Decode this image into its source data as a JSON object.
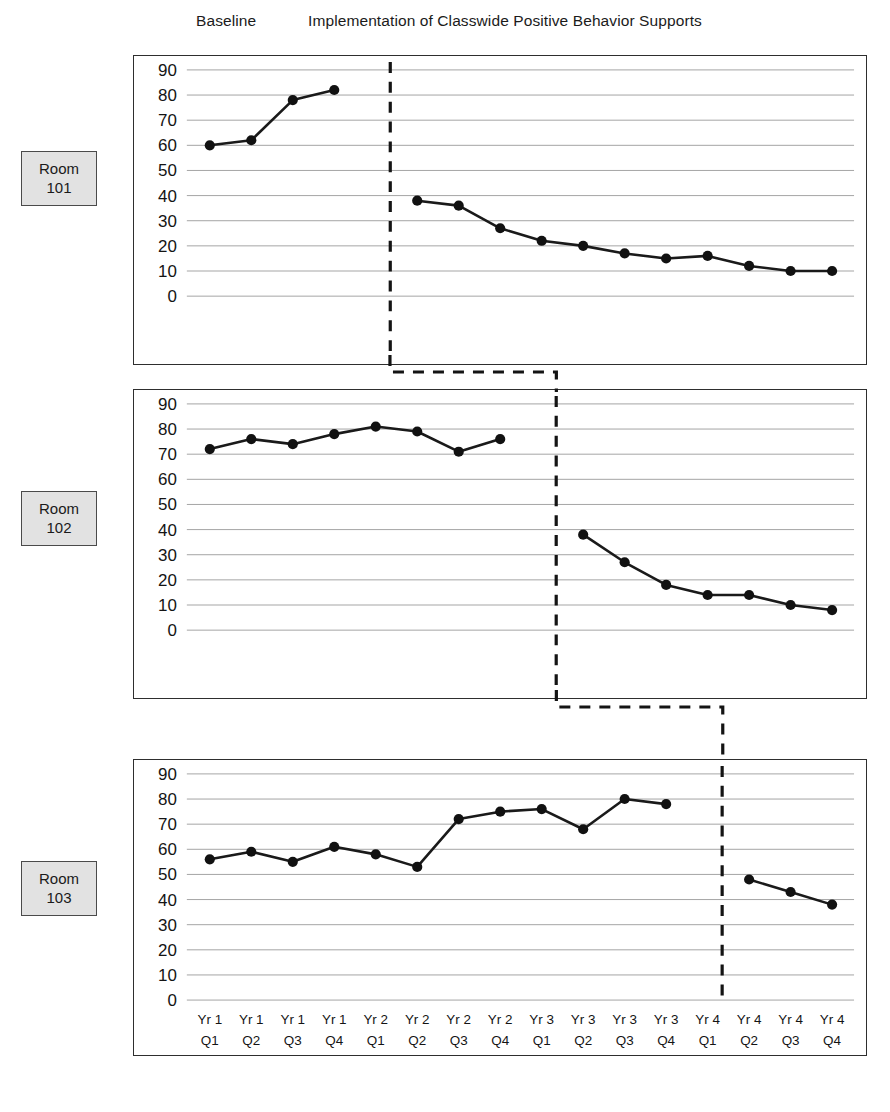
{
  "phases": {
    "baseline_label": "Baseline",
    "treatment_label": "Implementation of Classwide Positive Behavior Supports"
  },
  "rooms": [
    {
      "id": "101",
      "line1": "Room",
      "line2": "101"
    },
    {
      "id": "102",
      "line1": "Room",
      "line2": "102"
    },
    {
      "id": "103",
      "line1": "Room",
      "line2": "103"
    }
  ],
  "axis": {
    "y_ticks": [
      "90",
      "80",
      "70",
      "60",
      "50",
      "40",
      "30",
      "20",
      "10",
      "0"
    ],
    "x_ticks_top": [
      "Yr 1",
      "Yr 1",
      "Yr 1",
      "Yr 1",
      "Yr 2",
      "Yr 2",
      "Yr 2",
      "Yr 2",
      "Yr 3",
      "Yr 3",
      "Yr 3",
      "Yr 3",
      "Yr 4",
      "Yr 4",
      "Yr 4",
      "Yr 4"
    ],
    "x_ticks_bottom": [
      "Q1",
      "Q2",
      "Q3",
      "Q4",
      "Q1",
      "Q2",
      "Q3",
      "Q4",
      "Q1",
      "Q2",
      "Q3",
      "Q4",
      "Q1",
      "Q2",
      "Q3",
      "Q4"
    ]
  },
  "colors": {
    "line": "#1a1a1a",
    "grid": "#9a9a9a",
    "frame": "#2e2e2e",
    "label_box_fill": "#e2e2e2",
    "label_box_border": "#4a4a4a"
  },
  "chart_data": [
    {
      "type": "line",
      "title": "Room 101",
      "xlabel": "",
      "ylabel": "",
      "ylim": [
        0,
        95
      ],
      "grid": true,
      "legend": "none",
      "categories": [
        "Yr 1 Q1",
        "Yr 1 Q2",
        "Yr 1 Q3",
        "Yr 1 Q4",
        "Yr 2 Q1",
        "Yr 2 Q2",
        "Yr 2 Q3",
        "Yr 2 Q4",
        "Yr 3 Q1",
        "Yr 3 Q2",
        "Yr 3 Q3",
        "Yr 3 Q4",
        "Yr 4 Q1",
        "Yr 4 Q2",
        "Yr 4 Q3",
        "Yr 4 Q4"
      ],
      "series": [
        {
          "name": "Baseline",
          "x_index": [
            0,
            1,
            2,
            3
          ],
          "values": [
            60,
            62,
            78,
            82
          ]
        },
        {
          "name": "Implementation",
          "x_index": [
            5,
            6,
            7,
            8,
            9,
            10,
            11,
            12,
            13,
            14,
            15
          ],
          "values": [
            38,
            36,
            27,
            22,
            20,
            17,
            15,
            16,
            12,
            10,
            10
          ]
        }
      ],
      "phase_change_at_index": 4.35,
      "annotations": [
        "phase change line after Yr 1 Q4"
      ]
    },
    {
      "type": "line",
      "title": "Room 102",
      "xlabel": "",
      "ylabel": "",
      "ylim": [
        0,
        95
      ],
      "grid": true,
      "legend": "none",
      "categories": [
        "Yr 1 Q1",
        "Yr 1 Q2",
        "Yr 1 Q3",
        "Yr 1 Q4",
        "Yr 2 Q1",
        "Yr 2 Q2",
        "Yr 2 Q3",
        "Yr 2 Q4",
        "Yr 3 Q1",
        "Yr 3 Q2",
        "Yr 3 Q3",
        "Yr 3 Q4",
        "Yr 4 Q1",
        "Yr 4 Q2",
        "Yr 4 Q3",
        "Yr 4 Q4"
      ],
      "series": [
        {
          "name": "Baseline",
          "x_index": [
            0,
            1,
            2,
            3,
            4,
            5,
            6,
            7
          ],
          "values": [
            72,
            76,
            74,
            78,
            81,
            79,
            71,
            76
          ]
        },
        {
          "name": "Implementation",
          "x_index": [
            9,
            10,
            11,
            12,
            13,
            14,
            15
          ],
          "values": [
            38,
            27,
            18,
            14,
            14,
            10,
            8
          ]
        }
      ],
      "phase_change_at_index": 8.35,
      "annotations": [
        "phase change line after Yr 2 Q4"
      ]
    },
    {
      "type": "line",
      "title": "Room 103",
      "xlabel": "",
      "ylabel": "",
      "ylim": [
        0,
        95
      ],
      "grid": true,
      "legend": "none",
      "categories": [
        "Yr 1 Q1",
        "Yr 1 Q2",
        "Yr 1 Q3",
        "Yr 1 Q4",
        "Yr 2 Q1",
        "Yr 2 Q2",
        "Yr 2 Q3",
        "Yr 2 Q4",
        "Yr 3 Q1",
        "Yr 3 Q2",
        "Yr 3 Q3",
        "Yr 3 Q4",
        "Yr 4 Q1",
        "Yr 4 Q2",
        "Yr 4 Q3",
        "Yr 4 Q4"
      ],
      "series": [
        {
          "name": "Baseline",
          "x_index": [
            0,
            1,
            2,
            3,
            4,
            5,
            6,
            7,
            8,
            9,
            10,
            11
          ],
          "values": [
            56,
            59,
            55,
            61,
            58,
            53,
            72,
            75,
            76,
            68,
            80,
            78
          ]
        },
        {
          "name": "Implementation",
          "x_index": [
            13,
            14,
            15
          ],
          "values": [
            48,
            43,
            38
          ]
        }
      ],
      "phase_change_at_index": 12.35,
      "annotations": [
        "phase change line after Yr 3 Q4"
      ]
    }
  ]
}
